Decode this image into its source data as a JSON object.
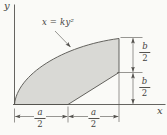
{
  "figure": {
    "curve_label": "x = ky²",
    "axes": {
      "y_label": "y",
      "x_label": "x"
    },
    "dimensions": {
      "bottom_left": {
        "num": "a",
        "den": "2"
      },
      "bottom_right": {
        "num": "a",
        "den": "2"
      },
      "right_top": {
        "num": "b",
        "den": "2"
      },
      "right_bottom": {
        "num": "b",
        "den": "2"
      }
    },
    "colors": {
      "background": "#fafaf7",
      "region_fill": "#d9d9d5",
      "line": "#54524e",
      "text": "#45443f"
    }
  }
}
